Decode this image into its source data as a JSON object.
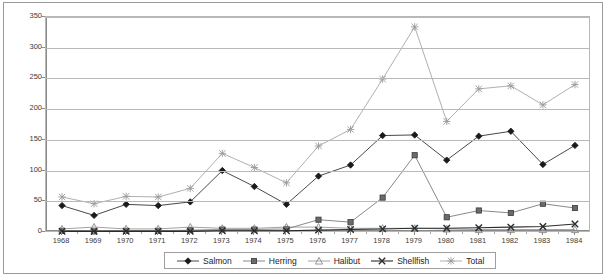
{
  "chart_data": {
    "type": "line",
    "title": "",
    "xlabel": "",
    "ylabel": "",
    "categories": [
      "1968",
      "1969",
      "1970",
      "1971",
      "1972",
      "1973",
      "1974",
      "1975",
      "1976",
      "1977",
      "1978",
      "1979",
      "1980",
      "1981",
      "1982",
      "1983",
      "1984"
    ],
    "ylim": [
      0,
      350
    ],
    "yticks": [
      0,
      50,
      100,
      150,
      200,
      250,
      300,
      350
    ],
    "grid": true,
    "legend_position": "bottom",
    "series": [
      {
        "name": "Salmon",
        "marker": "diamond",
        "color": "#1a1a1a",
        "values": [
          43,
          27,
          45,
          43,
          49,
          100,
          74,
          45,
          91,
          109,
          157,
          158,
          117,
          156,
          164,
          110,
          141
        ]
      },
      {
        "name": "Herring",
        "marker": "square",
        "color": "#6b6b6b",
        "values": [
          2,
          1,
          2,
          2,
          3,
          4,
          4,
          5,
          20,
          16,
          56,
          125,
          24,
          35,
          31,
          46,
          39
        ]
      },
      {
        "name": "Halibut",
        "marker": "triangle",
        "color": "#8a8a8a",
        "values": [
          5,
          8,
          5,
          5,
          8,
          6,
          6,
          8,
          8,
          6,
          6,
          6,
          5,
          4,
          4,
          4,
          4
        ]
      },
      {
        "name": "Shellfish",
        "marker": "x",
        "color": "#2b2b2b",
        "values": [
          1,
          1,
          1,
          1,
          1,
          2,
          2,
          2,
          3,
          4,
          5,
          6,
          6,
          7,
          8,
          9,
          13
        ]
      },
      {
        "name": "Total",
        "marker": "asterisk",
        "color": "#9a9a9a",
        "values": [
          57,
          46,
          58,
          57,
          71,
          128,
          105,
          80,
          140,
          167,
          249,
          334,
          180,
          233,
          238,
          207,
          240
        ]
      }
    ]
  },
  "legend": {
    "items": [
      {
        "label": "Salmon",
        "marker": "diamond"
      },
      {
        "label": "Herring",
        "marker": "square"
      },
      {
        "label": "Halibut",
        "marker": "triangle"
      },
      {
        "label": "Shellfish",
        "marker": "x"
      },
      {
        "label": "Total",
        "marker": "asterisk"
      }
    ]
  }
}
